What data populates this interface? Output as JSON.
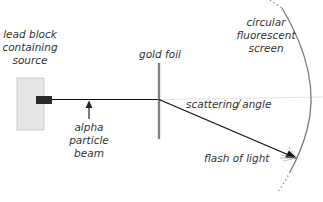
{
  "diagram": {
    "title": "",
    "labels": {
      "source": [
        "lead block",
        "containing",
        "source"
      ],
      "beam": [
        "alpha",
        "particle",
        "beam"
      ],
      "foil": "gold foil",
      "screen": [
        "circular",
        "fluorescent",
        "screen"
      ],
      "angle": "scattering angle",
      "flash": "flash of light"
    },
    "colors": {
      "background": "#ffffff",
      "lead_block": "#e6e6e6",
      "lead_block_border": "#bfbfbf",
      "source_emitter": "#2b2b2b",
      "beam": "#111111",
      "foil": "#808080",
      "screen": "#7a7a7a",
      "reference_line": "#d0d0d0",
      "text": "#333333"
    }
  }
}
